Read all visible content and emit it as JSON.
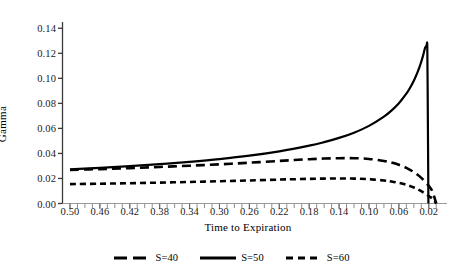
{
  "chart_data": {
    "type": "line",
    "title": "",
    "xlabel": "Time to Expiration",
    "ylabel": "Gamma",
    "xlim": [
      0.51,
      0.005
    ],
    "ylim": [
      0.0,
      0.145
    ],
    "x_inverted": true,
    "grid": false,
    "legend_position": "bottom",
    "x_tick_labels": [
      "0.50",
      "0.46",
      "0.42",
      "0.38",
      "0.34",
      "0.30",
      "0.26",
      "0.22",
      "0.18",
      "0.14",
      "0.10",
      "0.06",
      "0.02"
    ],
    "x_tick_values": [
      0.5,
      0.46,
      0.42,
      0.38,
      0.34,
      0.3,
      0.26,
      0.22,
      0.18,
      0.14,
      0.1,
      0.06,
      0.02
    ],
    "x_minor_tick_step": 0.01,
    "y_tick_labels": [
      "0.00",
      "0.02",
      "0.04",
      "0.06",
      "0.08",
      "0.10",
      "0.12",
      "0.14"
    ],
    "y_tick_values": [
      0.0,
      0.02,
      0.04,
      0.06,
      0.08,
      0.1,
      0.12,
      0.14
    ],
    "series": [
      {
        "name": "S=40",
        "label": "S=40",
        "style": "dashed-long",
        "color": "#000000",
        "dash_pattern": "9,5",
        "width": 2.6,
        "x": [
          0.5,
          0.46,
          0.42,
          0.38,
          0.34,
          0.3,
          0.26,
          0.22,
          0.2,
          0.18,
          0.16,
          0.14,
          0.12,
          0.1,
          0.08,
          0.07,
          0.06,
          0.05,
          0.04,
          0.03,
          0.02,
          0.015,
          0.01
        ],
        "values": [
          0.0268,
          0.0275,
          0.0283,
          0.0292,
          0.0302,
          0.0313,
          0.0326,
          0.034,
          0.0347,
          0.0354,
          0.0359,
          0.0362,
          0.0362,
          0.0356,
          0.034,
          0.0327,
          0.0309,
          0.0285,
          0.0251,
          0.0205,
          0.0141,
          0.0095,
          0.0
        ]
      },
      {
        "name": "S=50",
        "label": "S=50",
        "style": "solid",
        "color": "#000000",
        "dash_pattern": "",
        "width": 2.2,
        "x": [
          0.5,
          0.46,
          0.42,
          0.38,
          0.34,
          0.3,
          0.26,
          0.22,
          0.18,
          0.16,
          0.14,
          0.12,
          0.1,
          0.08,
          0.07,
          0.06,
          0.05,
          0.045,
          0.04,
          0.035,
          0.03,
          0.027,
          0.025,
          0.023,
          0.022,
          0.0215,
          0.0205
        ],
        "values": [
          0.0272,
          0.0285,
          0.0298,
          0.0314,
          0.0333,
          0.0355,
          0.0382,
          0.0417,
          0.0462,
          0.049,
          0.0524,
          0.0566,
          0.062,
          0.0694,
          0.0742,
          0.0801,
          0.0877,
          0.0925,
          0.0981,
          0.1049,
          0.1134,
          0.1196,
          0.1244,
          0.1262,
          0.1258,
          0.09,
          0.0
        ]
      },
      {
        "name": "S=60",
        "label": "S=60",
        "style": "dashed-short",
        "color": "#000000",
        "dash_pattern": "6,4",
        "width": 2.6,
        "x": [
          0.5,
          0.46,
          0.42,
          0.38,
          0.34,
          0.3,
          0.26,
          0.22,
          0.2,
          0.18,
          0.16,
          0.14,
          0.12,
          0.1,
          0.08,
          0.07,
          0.06,
          0.05,
          0.04,
          0.03,
          0.02,
          0.015,
          0.01
        ],
        "values": [
          0.0155,
          0.0158,
          0.0162,
          0.0167,
          0.0172,
          0.0178,
          0.0184,
          0.0191,
          0.0194,
          0.0197,
          0.0199,
          0.02,
          0.0199,
          0.0194,
          0.0184,
          0.0176,
          0.0165,
          0.015,
          0.0128,
          0.0098,
          0.0059,
          0.0037,
          0.0
        ]
      }
    ]
  },
  "legend": {
    "entries": [
      {
        "label": "S=40"
      },
      {
        "label": "S=50"
      },
      {
        "label": "S=60"
      }
    ]
  },
  "axes": {
    "y_title": "Gamma",
    "x_title": "Time to Expiration"
  }
}
